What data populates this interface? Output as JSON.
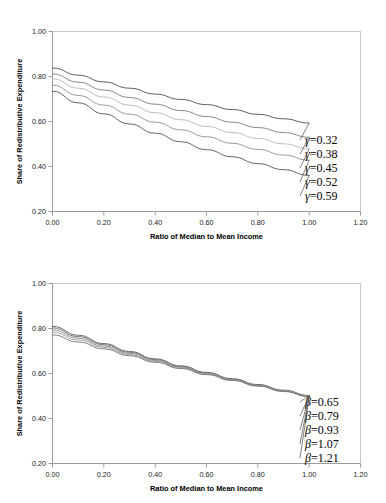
{
  "chart_data": [
    {
      "type": "line",
      "title": "",
      "xlabel": "Ratio of Median to Mean Income",
      "ylabel": "Share of Redistributive Expenditure",
      "xlim": [
        0.0,
        1.2
      ],
      "ylim": [
        0.2,
        1.0
      ],
      "xticks": [
        "0.00",
        "0.20",
        "0.40",
        "0.60",
        "0.80",
        "1.00",
        "1.20"
      ],
      "yticks": [
        "0.20",
        "0.40",
        "0.60",
        "0.80",
        "1.00"
      ],
      "grid": false,
      "legend_position": "right-inline",
      "x": [
        0.0,
        0.1,
        0.2,
        0.3,
        0.4,
        0.5,
        0.6,
        0.7,
        0.8,
        0.9,
        1.0
      ],
      "series": [
        {
          "name": "γ=0.32",
          "symbol": "γ",
          "value": "0.32",
          "color": "#4d4d4d",
          "values": [
            0.838,
            0.806,
            0.776,
            0.748,
            0.722,
            0.698,
            0.675,
            0.653,
            0.632,
            0.612,
            0.593
          ]
        },
        {
          "name": "γ=0.38",
          "symbol": "γ",
          "value": "0.38",
          "color": "#7a7a7a",
          "values": [
            0.812,
            0.775,
            0.74,
            0.707,
            0.677,
            0.649,
            0.622,
            0.597,
            0.573,
            0.551,
            0.53
          ]
        },
        {
          "name": "γ=0.45",
          "symbol": "γ",
          "value": "0.45",
          "color": "#b5b5b5",
          "values": [
            0.79,
            0.748,
            0.709,
            0.673,
            0.639,
            0.608,
            0.578,
            0.551,
            0.525,
            0.501,
            0.478
          ]
        },
        {
          "name": "γ=0.52",
          "symbol": "γ",
          "value": "0.52",
          "color": "#8f8f8f",
          "values": [
            0.762,
            0.716,
            0.673,
            0.633,
            0.597,
            0.563,
            0.532,
            0.503,
            0.476,
            0.451,
            0.428
          ]
        },
        {
          "name": "γ=0.59",
          "symbol": "γ",
          "value": "0.59",
          "color": "#555555",
          "values": [
            0.735,
            0.683,
            0.634,
            0.589,
            0.548,
            0.51,
            0.475,
            0.443,
            0.413,
            0.386,
            0.36
          ]
        }
      ]
    },
    {
      "type": "line",
      "title": "",
      "xlabel": "Ratio of Median to Mean Income",
      "ylabel": "Share of Redistributive Expenditure",
      "xlim": [
        0.0,
        1.2
      ],
      "ylim": [
        0.2,
        1.0
      ],
      "xticks": [
        "0.00",
        "0.20",
        "0.40",
        "0.60",
        "0.80",
        "1.00",
        "1.20"
      ],
      "yticks": [
        "0.20",
        "0.40",
        "0.60",
        "0.80",
        "1.00"
      ],
      "grid": false,
      "legend_position": "right-inline",
      "x": [
        0.0,
        0.1,
        0.2,
        0.3,
        0.4,
        0.5,
        0.6,
        0.7,
        0.8,
        0.9,
        1.0
      ],
      "series": [
        {
          "name": "β=0.65",
          "symbol": "β",
          "value": "0.65",
          "color": "#5a5a5a",
          "values": [
            0.81,
            0.77,
            0.733,
            0.698,
            0.665,
            0.634,
            0.605,
            0.577,
            0.551,
            0.526,
            0.502
          ]
        },
        {
          "name": "β=0.79",
          "symbol": "β",
          "value": "0.79",
          "color": "#6e6e6e",
          "values": [
            0.803,
            0.764,
            0.728,
            0.694,
            0.662,
            0.631,
            0.602,
            0.575,
            0.549,
            0.524,
            0.501
          ]
        },
        {
          "name": "β=0.93",
          "symbol": "β",
          "value": "0.93",
          "color": "#868686",
          "values": [
            0.794,
            0.757,
            0.722,
            0.689,
            0.658,
            0.628,
            0.6,
            0.573,
            0.547,
            0.523,
            0.5
          ]
        },
        {
          "name": "β=1.07",
          "symbol": "β",
          "value": "1.07",
          "color": "#9a9a9a",
          "values": [
            0.784,
            0.749,
            0.716,
            0.684,
            0.654,
            0.625,
            0.598,
            0.571,
            0.546,
            0.522,
            0.499
          ]
        },
        {
          "name": "β=1.21",
          "symbol": "β",
          "value": "1.21",
          "color": "#707070",
          "values": [
            0.772,
            0.74,
            0.709,
            0.679,
            0.65,
            0.622,
            0.595,
            0.569,
            0.544,
            0.52,
            0.497
          ]
        }
      ]
    }
  ]
}
